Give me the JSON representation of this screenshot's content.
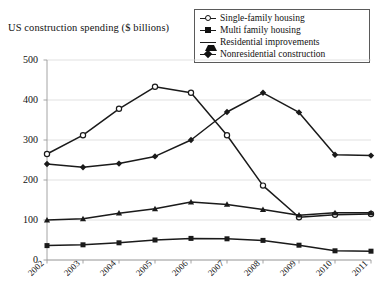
{
  "axis_title": "US construction spending ($ billions)",
  "legend": {
    "entries": [
      {
        "label": "Single-family housing",
        "marker": "circle-open",
        "icon": "line-marker-circle-open-icon"
      },
      {
        "label": "Multi family housing",
        "marker": "square",
        "icon": "line-marker-square-icon"
      },
      {
        "label": "Residential improvements",
        "marker": "triangle",
        "icon": "line-marker-triangle-icon"
      },
      {
        "label": "Nonresidential construction",
        "marker": "diamond",
        "icon": "line-marker-diamond-icon"
      }
    ]
  },
  "chart_data": {
    "type": "line",
    "title": "US construction spending ($ billions)",
    "xlabel": "",
    "ylabel": "US construction spending ($ billions)",
    "categories": [
      "2002",
      "2003",
      "2004",
      "2005",
      "2006",
      "2007",
      "2008",
      "2009",
      "2010",
      "2011"
    ],
    "yticks": [
      0,
      100,
      200,
      300,
      400,
      500
    ],
    "ylim": [
      0,
      500
    ],
    "grid": true,
    "legend_position": "top-right",
    "series": [
      {
        "name": "Single-family housing",
        "marker": "circle-open",
        "values": [
          265,
          312,
          378,
          433,
          418,
          312,
          186,
          107,
          113,
          115
        ]
      },
      {
        "name": "Multi family housing",
        "marker": "square",
        "values": [
          36,
          38,
          43,
          50,
          54,
          53,
          49,
          37,
          23,
          22
        ]
      },
      {
        "name": "Residential improvements",
        "marker": "triangle",
        "values": [
          100,
          103,
          117,
          128,
          145,
          139,
          126,
          112,
          118,
          118
        ]
      },
      {
        "name": "Nonresidential construction",
        "marker": "diamond",
        "values": [
          240,
          232,
          241,
          259,
          300,
          370,
          418,
          369,
          263,
          261
        ]
      }
    ]
  }
}
